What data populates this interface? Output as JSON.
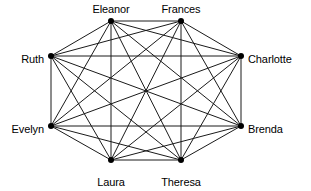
{
  "diagram": {
    "type": "graph",
    "background_color": "#ffffff",
    "edge_color": "#1a1a1a",
    "node_color": "#000000",
    "label_color": "#000000",
    "node_radius": 3,
    "edge_width": 1,
    "label_font_size": 11,
    "width": 311,
    "height": 191
  },
  "chart_data": {
    "type": "graph",
    "layout": "circular",
    "directed": false,
    "node_count": 8,
    "edge_count": 28,
    "complete_graph": true,
    "nodes": [
      {
        "id": "eleanor",
        "label": "Eleanor",
        "x": 111,
        "y": 21,
        "label_x": 111,
        "label_y": 13,
        "anchor": "middle",
        "baseline": "bottom"
      },
      {
        "id": "frances",
        "label": "Frances",
        "x": 181,
        "y": 21,
        "label_x": 181,
        "label_y": 13,
        "anchor": "middle",
        "baseline": "bottom"
      },
      {
        "id": "charlotte",
        "label": "Charlotte",
        "x": 241,
        "y": 56,
        "label_x": 248,
        "label_y": 59,
        "anchor": "start",
        "baseline": "middle"
      },
      {
        "id": "brenda",
        "label": "Brenda",
        "x": 241,
        "y": 126,
        "label_x": 248,
        "label_y": 129,
        "anchor": "start",
        "baseline": "middle"
      },
      {
        "id": "theresa",
        "label": "Theresa",
        "x": 181,
        "y": 160,
        "label_x": 181,
        "label_y": 178,
        "anchor": "middle",
        "baseline": "top"
      },
      {
        "id": "laura",
        "label": "Laura",
        "x": 111,
        "y": 160,
        "label_x": 111,
        "label_y": 178,
        "anchor": "middle",
        "baseline": "top"
      },
      {
        "id": "evelyn",
        "label": "Evelyn",
        "x": 51,
        "y": 126,
        "label_x": 44,
        "label_y": 129,
        "anchor": "end",
        "baseline": "middle"
      },
      {
        "id": "ruth",
        "label": "Ruth",
        "x": 51,
        "y": 56,
        "label_x": 44,
        "label_y": 59,
        "anchor": "end",
        "baseline": "middle"
      }
    ],
    "edges": [
      {
        "source": "eleanor",
        "target": "frances"
      },
      {
        "source": "eleanor",
        "target": "charlotte"
      },
      {
        "source": "eleanor",
        "target": "brenda"
      },
      {
        "source": "eleanor",
        "target": "theresa"
      },
      {
        "source": "eleanor",
        "target": "laura"
      },
      {
        "source": "eleanor",
        "target": "evelyn"
      },
      {
        "source": "eleanor",
        "target": "ruth"
      },
      {
        "source": "frances",
        "target": "charlotte"
      },
      {
        "source": "frances",
        "target": "brenda"
      },
      {
        "source": "frances",
        "target": "theresa"
      },
      {
        "source": "frances",
        "target": "laura"
      },
      {
        "source": "frances",
        "target": "evelyn"
      },
      {
        "source": "frances",
        "target": "ruth"
      },
      {
        "source": "charlotte",
        "target": "brenda"
      },
      {
        "source": "charlotte",
        "target": "theresa"
      },
      {
        "source": "charlotte",
        "target": "laura"
      },
      {
        "source": "charlotte",
        "target": "evelyn"
      },
      {
        "source": "charlotte",
        "target": "ruth"
      },
      {
        "source": "brenda",
        "target": "theresa"
      },
      {
        "source": "brenda",
        "target": "laura"
      },
      {
        "source": "brenda",
        "target": "evelyn"
      },
      {
        "source": "brenda",
        "target": "ruth"
      },
      {
        "source": "theresa",
        "target": "laura"
      },
      {
        "source": "theresa",
        "target": "evelyn"
      },
      {
        "source": "theresa",
        "target": "ruth"
      },
      {
        "source": "laura",
        "target": "evelyn"
      },
      {
        "source": "laura",
        "target": "ruth"
      },
      {
        "source": "evelyn",
        "target": "ruth"
      }
    ]
  }
}
